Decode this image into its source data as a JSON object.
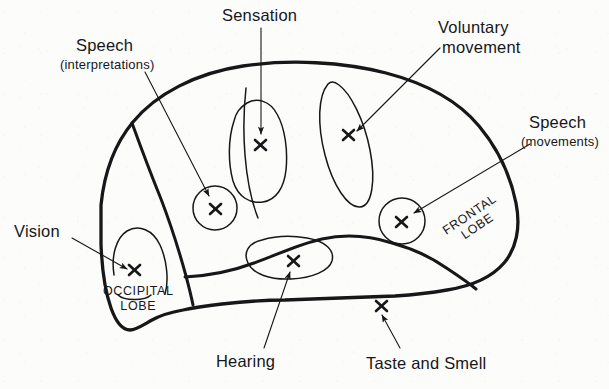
{
  "figure": {
    "background_color": "#fcfcfa",
    "ink_color": "#17171a"
  },
  "labels": {
    "speech_interpretations": {
      "line1": "Speech",
      "line2": "(interpretations)"
    },
    "sensation": "Sensation",
    "voluntary_movement": {
      "line1": "Voluntary",
      "line2": "movement"
    },
    "speech_movements": {
      "line1": "Speech",
      "line2": "(movements)"
    },
    "vision": "Vision",
    "hearing": "Hearing",
    "taste_and_smell": "Taste and Smell"
  },
  "lobes": {
    "occipital": {
      "line1": "OCCIPITAL",
      "line2": "LOBE"
    },
    "frontal": {
      "line1": "FRONTAL",
      "line2": "LOBE"
    }
  },
  "markers": {
    "glyph": "x",
    "points": [
      {
        "name": "speech-interpretations-marker",
        "x": 216,
        "y": 209
      },
      {
        "name": "sensation-marker",
        "x": 261,
        "y": 145
      },
      {
        "name": "voluntary-movement-marker",
        "x": 349,
        "y": 135
      },
      {
        "name": "speech-movements-marker",
        "x": 402,
        "y": 222
      },
      {
        "name": "vision-marker",
        "x": 134,
        "y": 270
      },
      {
        "name": "hearing-marker",
        "x": 293,
        "y": 261
      },
      {
        "name": "taste-and-smell-marker",
        "x": 381,
        "y": 306
      }
    ]
  }
}
